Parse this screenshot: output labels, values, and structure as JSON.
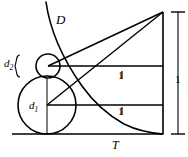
{
  "figure": {
    "type": "geometry-diagram",
    "background_color": "#ffffff",
    "stroke_color": "#000000",
    "labels": {
      "curve_D": "D",
      "tangent_T": "T",
      "diameter_small": "d",
      "diameter_small_sub": "2",
      "diameter_large": "d",
      "diameter_large_sub": "1",
      "unit_upper": "1",
      "unit_lower": "1",
      "unit_right": "1"
    },
    "geometry": {
      "apex_point": [
        163,
        12
      ],
      "baseline_y": 134,
      "right_edge_x": 163,
      "left_edge_x": 12,
      "small_circle": {
        "cx": 48,
        "cy": 66,
        "r": 12
      },
      "large_circle": {
        "cx": 47,
        "cy": 105,
        "r": 29
      },
      "upper_chord_y": 66,
      "lower_chord_y": 105,
      "dimension_x": 178,
      "dimension_top_y": 12,
      "dimension_bottom_y": 134
    }
  }
}
